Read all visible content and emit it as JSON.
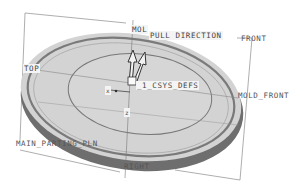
{
  "viewport": {
    "background": "#ffffff",
    "part_fill": "#d2d2d2",
    "part_shadow": "#6a6a6a",
    "line_color": "#888888"
  },
  "datum_labels": {
    "pull_direction": "PULL DIRECTION",
    "mold_partial": "MOL",
    "front": "FRONT",
    "top": "TOP",
    "csys": "_1_CSYS_DEFS",
    "mold_front": "MOLD_FRONT",
    "main_parting_pln": "MAIN_PARTING_PLN",
    "right": "RIGHT",
    "axis_x": "x",
    "axis_z": "z"
  }
}
